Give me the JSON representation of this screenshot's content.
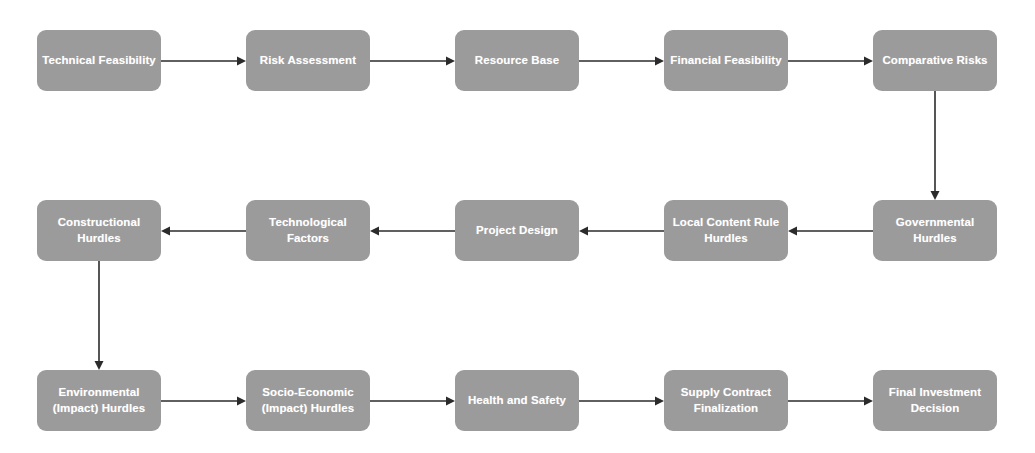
{
  "diagram": {
    "node_fill_color": "#9b9b9b",
    "node_text_color": "#ffffff",
    "arrow_color": "#2b2b2b",
    "background_color": "#ffffff",
    "rows": [
      {
        "direction": "left-to-right",
        "nodes": [
          {
            "label": "Technical Feasibility",
            "x": 37,
            "y": 30,
            "w": 124,
            "h": 61
          },
          {
            "label": "Risk Assessment",
            "x": 246,
            "y": 30,
            "w": 124,
            "h": 61
          },
          {
            "label": "Resource Base",
            "x": 455,
            "y": 30,
            "w": 124,
            "h": 61
          },
          {
            "label": "Financial Feasibility",
            "x": 664,
            "y": 30,
            "w": 124,
            "h": 61
          },
          {
            "label": "Comparative Risks",
            "x": 873,
            "y": 30,
            "w": 124,
            "h": 61
          }
        ]
      },
      {
        "direction": "right-to-left",
        "nodes": [
          {
            "label": "Constructional Hurdles",
            "x": 37,
            "y": 200,
            "w": 124,
            "h": 61
          },
          {
            "label": "Technological Factors",
            "x": 246,
            "y": 200,
            "w": 124,
            "h": 61
          },
          {
            "label": "Project Design",
            "x": 455,
            "y": 200,
            "w": 124,
            "h": 61
          },
          {
            "label": "Local Content Rule Hurdles",
            "x": 664,
            "y": 200,
            "w": 124,
            "h": 61
          },
          {
            "label": "Governmental Hurdles",
            "x": 873,
            "y": 200,
            "w": 124,
            "h": 61
          }
        ]
      },
      {
        "direction": "left-to-right",
        "nodes": [
          {
            "label": "Environmental (Impact) Hurdles",
            "x": 37,
            "y": 370,
            "w": 124,
            "h": 61
          },
          {
            "label": "Socio-Economic (Impact) Hurdles",
            "x": 246,
            "y": 370,
            "w": 124,
            "h": 61
          },
          {
            "label": "Health and Safety",
            "x": 455,
            "y": 370,
            "w": 124,
            "h": 61
          },
          {
            "label": "Supply Contract Finalization",
            "x": 664,
            "y": 370,
            "w": 124,
            "h": 61
          },
          {
            "label": "Final Investment Decision",
            "x": 873,
            "y": 370,
            "w": 124,
            "h": 61
          }
        ]
      }
    ],
    "connectors": [
      {
        "name": "technical-feasibility-to-risk-assessment",
        "type": "horizontal-right",
        "x1": 161,
        "y1": 61,
        "x2": 246,
        "y2": 61
      },
      {
        "name": "risk-assessment-to-resource-base",
        "type": "horizontal-right",
        "x1": 370,
        "y1": 61,
        "x2": 455,
        "y2": 61
      },
      {
        "name": "resource-base-to-financial-feasibility",
        "type": "horizontal-right",
        "x1": 579,
        "y1": 61,
        "x2": 664,
        "y2": 61
      },
      {
        "name": "financial-feasibility-to-comparative-risks",
        "type": "horizontal-right",
        "x1": 788,
        "y1": 61,
        "x2": 873,
        "y2": 61
      },
      {
        "name": "comparative-risks-to-governmental-hurdles",
        "type": "vertical-down",
        "x1": 935,
        "y1": 91,
        "x2": 935,
        "y2": 200
      },
      {
        "name": "governmental-hurdles-to-local-content-rule-hurdles",
        "type": "horizontal-left",
        "x1": 873,
        "y1": 231,
        "x2": 788,
        "y2": 231
      },
      {
        "name": "local-content-rule-hurdles-to-project-design",
        "type": "horizontal-left",
        "x1": 664,
        "y1": 231,
        "x2": 579,
        "y2": 231
      },
      {
        "name": "project-design-to-technological-factors",
        "type": "horizontal-left",
        "x1": 455,
        "y1": 231,
        "x2": 370,
        "y2": 231
      },
      {
        "name": "technological-factors-to-constructional-hurdles",
        "type": "horizontal-left",
        "x1": 246,
        "y1": 231,
        "x2": 161,
        "y2": 231
      },
      {
        "name": "constructional-hurdles-to-environmental-impact-hurdles",
        "type": "vertical-down",
        "x1": 99,
        "y1": 261,
        "x2": 99,
        "y2": 370
      },
      {
        "name": "environmental-to-socio-economic-hurdles",
        "type": "horizontal-right",
        "x1": 161,
        "y1": 401,
        "x2": 246,
        "y2": 401
      },
      {
        "name": "socio-economic-to-health-and-safety",
        "type": "horizontal-right",
        "x1": 370,
        "y1": 401,
        "x2": 455,
        "y2": 401
      },
      {
        "name": "health-and-safety-to-supply-contract-finalization",
        "type": "horizontal-right",
        "x1": 579,
        "y1": 401,
        "x2": 664,
        "y2": 401
      },
      {
        "name": "supply-contract-to-final-investment-decision",
        "type": "horizontal-right",
        "x1": 788,
        "y1": 401,
        "x2": 873,
        "y2": 401
      }
    ]
  }
}
